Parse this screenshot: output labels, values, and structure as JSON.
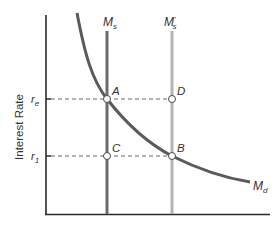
{
  "diagram": {
    "y_axis_label": "Interest Rate",
    "y_ticks": [
      {
        "label": "r",
        "sub": "e",
        "y": 99
      },
      {
        "label": "r",
        "sub": "1",
        "y": 156
      }
    ],
    "curves": {
      "money_supply": {
        "label": "M",
        "sub": "s",
        "color": "#6b6b6b"
      },
      "money_supply_new": {
        "label": "M",
        "sub": "s",
        "prime": "'",
        "color": "#b0b0b0"
      },
      "money_demand": {
        "label": "M",
        "sub": "d",
        "color": "#5a5a5a"
      }
    },
    "points": [
      {
        "label": "A",
        "x": 107,
        "y": 99
      },
      {
        "label": "D",
        "x": 172,
        "y": 99
      },
      {
        "label": "C",
        "x": 107,
        "y": 156
      },
      {
        "label": "B",
        "x": 172,
        "y": 156
      }
    ],
    "colors": {
      "axis": "#2b2b2b",
      "dashed": "#555555",
      "text": "#333333"
    }
  }
}
